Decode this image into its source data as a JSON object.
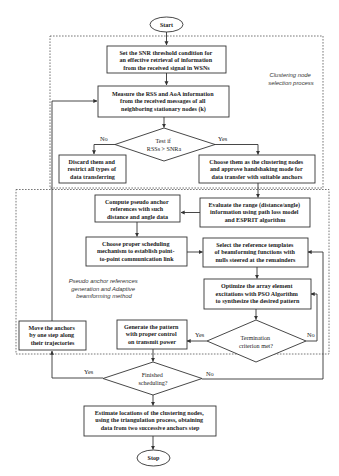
{
  "nodes": {
    "start": {
      "lines": [
        "Start"
      ]
    },
    "set_snr": {
      "lines": [
        "Set the SNR threshold condition for",
        "an effective retrieval of information",
        "from the received signal in WSNs"
      ]
    },
    "measure": {
      "lines": [
        "Measure the RSS and AoA information",
        "from the received messages of all",
        "neighboring stationary nodes (k)"
      ]
    },
    "test_if": {
      "lines": [
        "Test if",
        "RSSs > SNRa"
      ]
    },
    "discard": {
      "lines": [
        "Discard them and",
        "restrict all types of",
        "data transferring"
      ]
    },
    "choose_clustering": {
      "lines": [
        "Choose them as the clustering nodes",
        "and approve handshaking mode for",
        "data transfer with suitable anchors"
      ]
    },
    "evaluate": {
      "lines": [
        "Evaluate the range (distance/angle)",
        "information using path loss model",
        "and ESPRIT algorithm"
      ]
    },
    "compute_pseudo": {
      "lines": [
        "Compute pseudo anchor",
        "references with such",
        "distance and angle data"
      ]
    },
    "choose_scheduling": {
      "lines": [
        "Choose proper scheduling",
        "mechanism to establish point-",
        "to-point communication link"
      ]
    },
    "select_templates": {
      "lines": [
        "Select the reference templates",
        "of beamforming functions with",
        "nulls steered at the remainders"
      ]
    },
    "optimize": {
      "lines": [
        "Optimize the array element",
        "excitations with PSO Algorithm",
        "to synthesize the desired pattern"
      ]
    },
    "termination": {
      "lines": [
        "Termination",
        "criterion met?"
      ]
    },
    "generate": {
      "lines": [
        "Generate the pattern",
        "with proper control",
        "on transmit power"
      ]
    },
    "move_anchors": {
      "lines": [
        "Move the anchors",
        "by one step along",
        "their trajectories"
      ]
    },
    "finished": {
      "lines": [
        "Finished",
        "scheduling?"
      ]
    },
    "estimate": {
      "lines": [
        "Estimate locations of the clustering nodes,",
        "using the triangulation process, obtaining",
        "data from two successive anchors step"
      ]
    },
    "stop": {
      "lines": [
        "Stop"
      ]
    }
  },
  "edge_labels": {
    "test_no": "No",
    "test_yes": "Yes",
    "termination_yes": "Yes",
    "termination_no": "No",
    "finished_yes": "Yes",
    "finished_no": "No"
  },
  "regions": {
    "clustering": {
      "lines": [
        "Clustering node",
        "selection process"
      ]
    },
    "pseudo_anchor": {
      "lines": [
        "Pseudo anchor references",
        "generation and Adaptive",
        "beamforming method"
      ]
    }
  },
  "colors": {
    "stroke": "#333333",
    "background": "#ffffff",
    "text": "#222222"
  }
}
